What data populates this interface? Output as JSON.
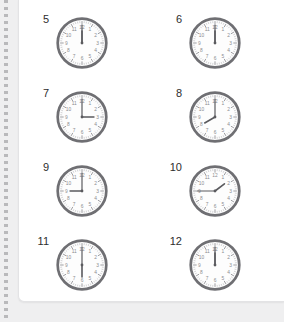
{
  "worksheet": {
    "title": "Telling Time Worksheet",
    "background_color": "#efeff0",
    "page_color": "#ffffff",
    "edge_style": "perforated-dotted-left-margin"
  },
  "clock_style": {
    "rim_color": "#6f6f73",
    "face_color": "#fdfdfd",
    "hand_color": "#5a5a5e",
    "tick_color": "#9a9a9e",
    "numeral_color": "#8c8c90",
    "numerals": [
      "12",
      "1",
      "2",
      "3",
      "4",
      "5",
      "6",
      "7",
      "8",
      "9",
      "10",
      "11"
    ]
  },
  "problems": [
    {
      "number": "5",
      "time": "12:00",
      "hour": 12,
      "minute": 0
    },
    {
      "number": "6",
      "time": "12:00",
      "hour": 12,
      "minute": 0
    },
    {
      "number": "7",
      "time": "3:00",
      "hour": 3,
      "minute": 0
    },
    {
      "number": "8",
      "time": "8:00",
      "hour": 8,
      "minute": 0
    },
    {
      "number": "9",
      "time": "9:00",
      "hour": 9,
      "minute": 0
    },
    {
      "number": "10",
      "time": "1:45",
      "hour": 1,
      "minute": 45
    },
    {
      "number": "11",
      "time": "6:00",
      "hour": 6,
      "minute": 0
    },
    {
      "number": "12",
      "time": "12:00",
      "hour": 12,
      "minute": 0
    }
  ]
}
